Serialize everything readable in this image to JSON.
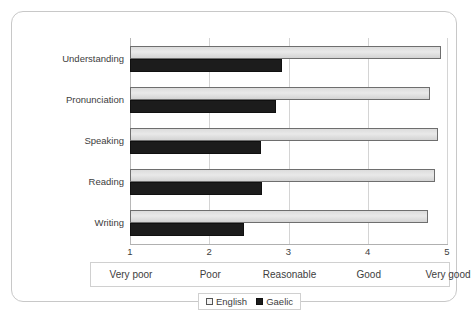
{
  "chart_data": {
    "type": "bar",
    "orientation": "horizontal",
    "title": "",
    "xlabel": "",
    "ylabel": "",
    "xlim": [
      1,
      5
    ],
    "grid": true,
    "legend_position": "bottom",
    "categories": [
      "Understanding",
      "Pronunciation",
      "Speaking",
      "Reading",
      "Writing"
    ],
    "series": [
      {
        "name": "English",
        "color": "#e3e3e3",
        "values": [
          4.92,
          4.78,
          4.89,
          4.85,
          4.76
        ]
      },
      {
        "name": "Gaelic",
        "color": "#1c1c1c",
        "values": [
          2.92,
          2.84,
          2.65,
          2.66,
          2.44
        ]
      }
    ],
    "x_ticks": [
      {
        "value": 1,
        "label": "1"
      },
      {
        "value": 2,
        "label": "2"
      },
      {
        "value": 3,
        "label": "3"
      },
      {
        "value": 4,
        "label": "4"
      },
      {
        "value": 5,
        "label": "5"
      }
    ],
    "scale_bands": [
      {
        "value": 1,
        "label": "Very poor"
      },
      {
        "value": 2,
        "label": "Poor"
      },
      {
        "value": 3,
        "label": "Reasonable"
      },
      {
        "value": 4,
        "label": "Good"
      },
      {
        "value": 5,
        "label": "Very good"
      }
    ]
  },
  "legend": {
    "entries": [
      {
        "label": "English"
      },
      {
        "label": "Gaelic"
      }
    ]
  }
}
